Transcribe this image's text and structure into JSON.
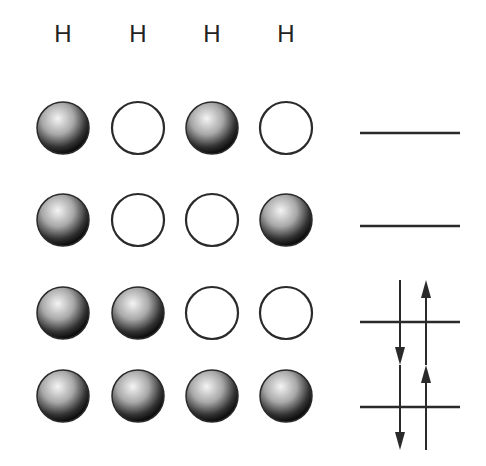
{
  "diagram": {
    "title": "",
    "atom_labels": [
      "H",
      "H",
      "H",
      "H"
    ],
    "columns_x": [
      63,
      138,
      212,
      286
    ],
    "label_y": 22,
    "orbitals": [
      {
        "name": "orbital-4",
        "y": 128,
        "phases": [
          "filled",
          "empty",
          "filled",
          "empty"
        ],
        "level_y": 133,
        "electrons": []
      },
      {
        "name": "orbital-3",
        "y": 220,
        "phases": [
          "filled",
          "empty",
          "empty",
          "filled"
        ],
        "level_y": 226,
        "electrons": []
      },
      {
        "name": "orbital-2",
        "y": 313,
        "phases": [
          "filled",
          "filled",
          "empty",
          "empty"
        ],
        "level_y": 322,
        "electrons": [
          "down",
          "up"
        ]
      },
      {
        "name": "orbital-1",
        "y": 396,
        "phases": [
          "filled",
          "filled",
          "filled",
          "filled"
        ],
        "level_y": 407,
        "electrons": [
          "down",
          "up"
        ]
      }
    ],
    "colors": {
      "line": "#2a2a2a",
      "sphere_dark": "#111111",
      "sphere_light": "#f2f2f2"
    }
  }
}
